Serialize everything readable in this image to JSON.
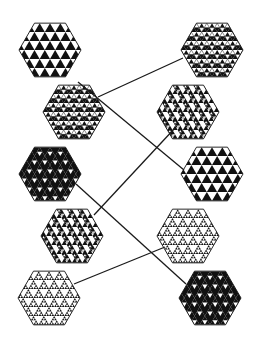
{
  "diagram": {
    "type": "matching-pairs",
    "colors": {
      "ink": "#111111",
      "paper": "#ffffff",
      "line": "#1a1a1a"
    },
    "hex_radius": 31,
    "left_column": [
      {
        "id": "L1",
        "cx": 50,
        "cy": 50,
        "pattern": "big"
      },
      {
        "id": "L2",
        "cx": 74,
        "cy": 112,
        "pattern": "outlined"
      },
      {
        "id": "L3",
        "cx": 50,
        "cy": 174,
        "pattern": "holes"
      },
      {
        "id": "L4",
        "cx": 72,
        "cy": 236,
        "pattern": "mixed"
      },
      {
        "id": "L5",
        "cx": 49,
        "cy": 298,
        "pattern": "sierpinski"
      }
    ],
    "right_column": [
      {
        "id": "R1",
        "cx": 212,
        "cy": 50,
        "pattern": "outlined"
      },
      {
        "id": "R2",
        "cx": 188,
        "cy": 112,
        "pattern": "mixed"
      },
      {
        "id": "R3",
        "cx": 212,
        "cy": 174,
        "pattern": "big"
      },
      {
        "id": "R4",
        "cx": 188,
        "cy": 236,
        "pattern": "sierpinski"
      },
      {
        "id": "R5",
        "cx": 210,
        "cy": 298,
        "pattern": "holes"
      }
    ],
    "connections": [
      {
        "from": "L1",
        "to": "R3",
        "x1": 78,
        "y1": 82,
        "x2": 184,
        "y2": 170
      },
      {
        "from": "L2",
        "to": "R1",
        "x1": 98,
        "y1": 97,
        "x2": 183,
        "y2": 58
      },
      {
        "from": "L3",
        "to": "R5",
        "x1": 76,
        "y1": 184,
        "x2": 186,
        "y2": 284
      },
      {
        "from": "L4",
        "to": "R2",
        "x1": 94,
        "y1": 215,
        "x2": 175,
        "y2": 128
      },
      {
        "from": "L5",
        "to": "R4",
        "x1": 74,
        "y1": 284,
        "x2": 165,
        "y2": 247
      }
    ]
  }
}
